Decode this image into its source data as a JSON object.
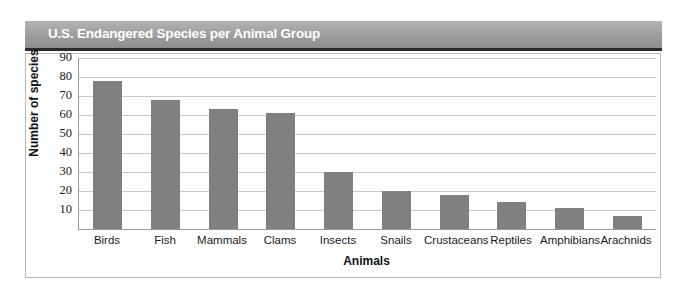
{
  "chart_data": {
    "type": "bar",
    "title": "U.S. Endangered Species per Animal Group",
    "xlabel": "Animals",
    "ylabel": "Number of species",
    "categories": [
      "Birds",
      "Fish",
      "Mammals",
      "Clams",
      "Insects",
      "Snails",
      "Crustaceans",
      "Reptiles",
      "Amphibians",
      "Arachnids"
    ],
    "values": [
      78,
      68,
      63,
      61,
      30,
      20,
      18,
      14,
      11,
      7
    ],
    "ylim": [
      0,
      90
    ],
    "yticks": [
      10,
      20,
      30,
      40,
      50,
      60,
      70,
      80,
      90
    ],
    "ytick_labels": [
      "10",
      "20",
      "30",
      "40",
      "50",
      "60",
      "70",
      "80",
      "90"
    ],
    "grid": true,
    "legend": false,
    "bar_color": "#808080",
    "title_background": "#9d9d9d",
    "title_color": "#ffffff",
    "gridline_color": "#c9c9c9",
    "axis_color": "#9a9a9a"
  }
}
